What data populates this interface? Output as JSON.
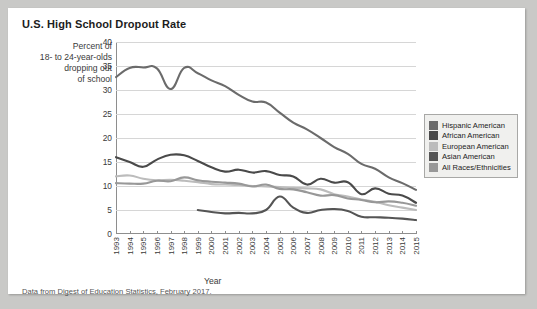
{
  "figure": {
    "title": "U.S. High School Dropout Rate",
    "ylabel_lines": [
      "Percent of",
      "18- to 24-year-olds",
      "dropping out",
      "of school"
    ],
    "xlabel": "Year",
    "footer": "Data from Digest of Education Statistics, February 2017."
  },
  "colors": {
    "background": "#c9c9c7",
    "card": "#ffffff",
    "grid": "#d6d6d6",
    "axis": "#8e8e8e",
    "legend_background": "#f0f0ee",
    "legend_border": "#a8a8a6",
    "hispanic": "#6b6b6b",
    "african": "#4a4a4a",
    "european": "#bcbcbc",
    "asian": "#555555",
    "allraces": "#989898"
  },
  "chart_data": {
    "type": "line",
    "title": "U.S. High School Dropout Rate",
    "xlabel": "Year",
    "ylabel": "Percent of 18- to 24-year-olds dropping out of school",
    "xlim": [
      1993,
      2015
    ],
    "ylim": [
      0,
      40
    ],
    "yticks": [
      0,
      5,
      10,
      15,
      20,
      25,
      30,
      35,
      40
    ],
    "grid": true,
    "legend_position": "right",
    "categories": [
      "1993",
      "1994",
      "1995",
      "1996",
      "1997",
      "1998",
      "1999",
      "2000",
      "2001",
      "2002",
      "2003",
      "2004",
      "2005",
      "2006",
      "2007",
      "2008",
      "2009",
      "2010",
      "2011",
      "2012",
      "2013",
      "2014",
      "2015"
    ],
    "series": [
      {
        "name": "Hispanic American",
        "color": "#6b6b6b",
        "values": [
          32.7,
          34.6,
          34.7,
          34.5,
          30.2,
          34.6,
          33.5,
          32.0,
          30.8,
          29.0,
          27.6,
          27.4,
          25.3,
          23.2,
          21.8,
          20.0,
          18.1,
          16.7,
          14.6,
          13.6,
          11.8,
          10.6,
          9.2
        ]
      },
      {
        "name": "African American",
        "color": "#4a4a4a",
        "values": [
          16.0,
          15.0,
          14.0,
          15.5,
          16.5,
          16.4,
          15.2,
          13.9,
          13.0,
          13.4,
          12.8,
          13.1,
          12.3,
          12.0,
          10.3,
          11.5,
          10.7,
          10.8,
          8.3,
          9.5,
          8.4,
          8.0,
          6.5
        ]
      },
      {
        "name": "European American",
        "color": "#bcbcbc",
        "values": [
          12.0,
          12.2,
          11.5,
          11.2,
          11.3,
          11.1,
          10.8,
          10.4,
          10.3,
          10.2,
          10.0,
          9.9,
          9.8,
          9.6,
          9.5,
          9.3,
          8.3,
          7.8,
          7.2,
          6.7,
          6.0,
          5.5,
          5.0
        ]
      },
      {
        "name": "Asian American",
        "color": "#555555",
        "values": [
          null,
          null,
          null,
          null,
          null,
          null,
          5.0,
          4.6,
          4.3,
          4.4,
          4.3,
          5.0,
          7.8,
          5.5,
          4.4,
          5.0,
          5.2,
          4.8,
          3.6,
          3.5,
          3.4,
          3.2,
          2.9
        ]
      },
      {
        "name": "All Races/Ethnicities",
        "color": "#989898",
        "values": [
          10.6,
          10.5,
          10.5,
          11.1,
          11.0,
          11.8,
          11.2,
          10.9,
          10.7,
          10.5,
          9.9,
          10.3,
          9.4,
          9.3,
          8.7,
          8.0,
          8.1,
          7.4,
          7.1,
          6.6,
          6.8,
          6.5,
          5.9
        ]
      }
    ]
  },
  "legend": {
    "items": [
      {
        "label": "Hispanic American",
        "color": "#6b6b6b"
      },
      {
        "label": "African American",
        "color": "#4a4a4a"
      },
      {
        "label": "European American",
        "color": "#bcbcbc"
      },
      {
        "label": "Asian American",
        "color": "#555555"
      },
      {
        "label": "All Races/Ethnicities",
        "color": "#989898"
      }
    ]
  }
}
